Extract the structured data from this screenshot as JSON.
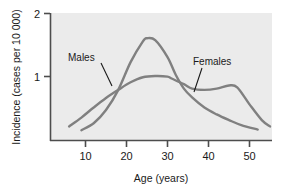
{
  "chart_data": {
    "type": "line",
    "title": "",
    "subtitle": "",
    "xlabel": "Age (years)",
    "ylabel": "Incidence (cases per 10 000)",
    "xlim": [
      4,
      57
    ],
    "ylim": [
      0,
      2
    ],
    "xticks": [
      10,
      20,
      30,
      40,
      50
    ],
    "xtick_labels": [
      "10",
      "20",
      "30",
      "40",
      "50"
    ],
    "yticks": [
      1,
      2
    ],
    "ytick_labels": [
      "1",
      "2"
    ],
    "grid": false,
    "legend_position": "inline-annotations",
    "plot_background": "#ebebeb",
    "line_color": "#808080",
    "axis_color": "#4d4d4d",
    "series": [
      {
        "name": "Males",
        "label_text": "Males",
        "color": "#808080",
        "x": [
          9,
          12,
          15,
          18,
          21,
          24,
          25,
          27,
          30,
          32,
          34,
          36,
          39,
          42,
          45,
          48,
          52
        ],
        "values": [
          0.14,
          0.25,
          0.46,
          0.78,
          1.22,
          1.55,
          1.6,
          1.57,
          1.3,
          1.02,
          0.8,
          0.66,
          0.5,
          0.39,
          0.3,
          0.22,
          0.15
        ]
      },
      {
        "name": "Females",
        "label_text": "Females",
        "color": "#808080",
        "x": [
          6,
          9,
          12,
          15,
          18,
          21,
          24,
          27,
          30,
          31,
          34,
          36,
          39,
          42,
          45,
          47,
          50,
          53,
          55
        ],
        "values": [
          0.2,
          0.34,
          0.5,
          0.65,
          0.78,
          0.9,
          0.98,
          1.0,
          0.99,
          0.96,
          0.87,
          0.8,
          0.78,
          0.8,
          0.85,
          0.82,
          0.55,
          0.3,
          0.2
        ]
      }
    ],
    "annotations": [
      {
        "text": "Males",
        "label_x_px": 68,
        "label_y_px": 61,
        "leader_from_px": [
          101,
          63
        ],
        "leader_to_px": [
          112,
          86
        ]
      },
      {
        "text": "Females",
        "label_x_px": 193,
        "label_y_px": 65,
        "leader_from_px": [
          202,
          68
        ],
        "leader_to_px": [
          194,
          92
        ]
      }
    ]
  }
}
